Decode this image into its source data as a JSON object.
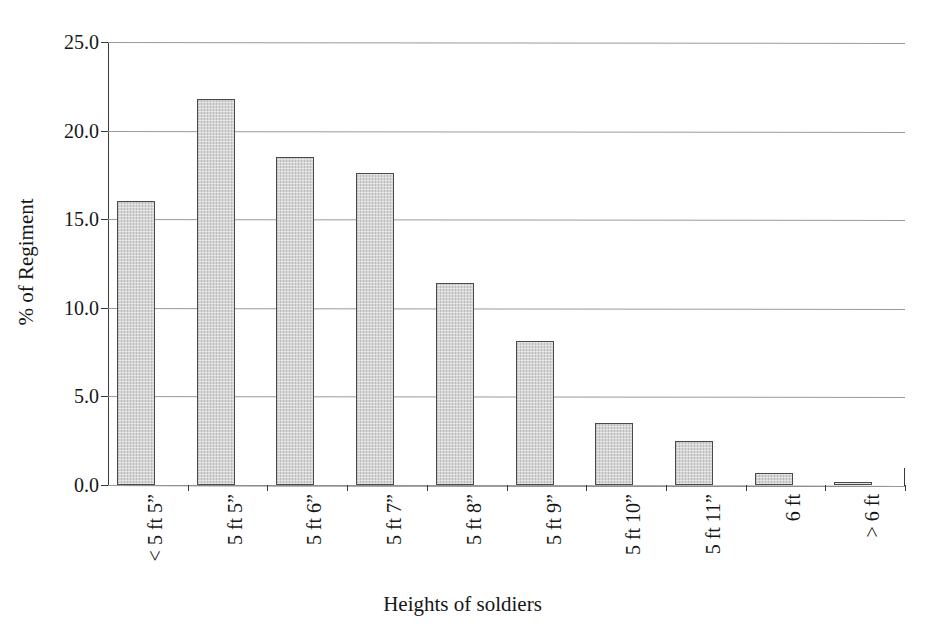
{
  "top_cut_text": "· · · · · · · · · · · · · · · · · ·",
  "chart_data": {
    "type": "bar",
    "title": "",
    "xlabel": "Heights of soldiers",
    "ylabel": "% of Regiment",
    "categories": [
      "< 5 ft 5”",
      "5 ft 5”",
      "5 ft 6”",
      "5 ft 7”",
      "5 ft 8”",
      "5 ft 9”",
      "5 ft 10”",
      "5 ft 11”",
      "6 ft",
      "> 6 ft"
    ],
    "values": [
      16.0,
      21.8,
      18.5,
      17.6,
      11.4,
      8.1,
      3.5,
      2.5,
      0.7,
      0.15
    ],
    "ylim": [
      0.0,
      25.0
    ],
    "ytick_labels": [
      "25.0",
      "20.0",
      "15.0",
      "10.0",
      "5.0",
      "0.0"
    ],
    "ytick_values": [
      25.0,
      20.0,
      15.0,
      10.0,
      5.0,
      0.0
    ],
    "grid": "horizontal",
    "legend": "none",
    "bar_fill_color": "#c6c6c6",
    "bar_edge_color": "#4a4a4a",
    "gridline_color": "#9a9a9a",
    "axis_color": "#3a3a3a"
  }
}
